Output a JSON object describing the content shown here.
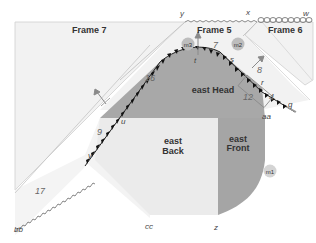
{
  "diagram": {
    "frames": [
      {
        "id": "frame7",
        "label": "Frame 7"
      },
      {
        "id": "frame5",
        "label": "Frame 5"
      },
      {
        "id": "frame6",
        "label": "Frame 6"
      }
    ],
    "regions": [
      {
        "id": "east-head",
        "line1": "east Head"
      },
      {
        "id": "east-back",
        "line1": "east",
        "line2": "Back"
      },
      {
        "id": "east-front",
        "line1": "east",
        "line2": "Front"
      }
    ],
    "points": {
      "y": "y",
      "x": "x",
      "w": "w",
      "t": "t",
      "s": "s",
      "r": "r",
      "q": "q",
      "u": "u",
      "v": "v",
      "aa": "aa",
      "bb": "bb",
      "cc": "cc",
      "z": "z"
    },
    "numbers": {
      "n7": "7",
      "n8": "8",
      "n4": "4",
      "n12": "12",
      "n16": "16",
      "n9": "9",
      "n17": "17"
    },
    "markers": {
      "m1": "m1",
      "m2": "m2",
      "m3": "m3"
    },
    "colors": {
      "frame_fill": "#f0f0f0",
      "frame_line": "#c8c8c8",
      "head_fill": "#a9a9a9",
      "back_fill": "#ececec",
      "front_fill": "#a6a6a6",
      "marker_fill": "#bfbfbf",
      "arrow_color": "#8a8a8a"
    }
  }
}
